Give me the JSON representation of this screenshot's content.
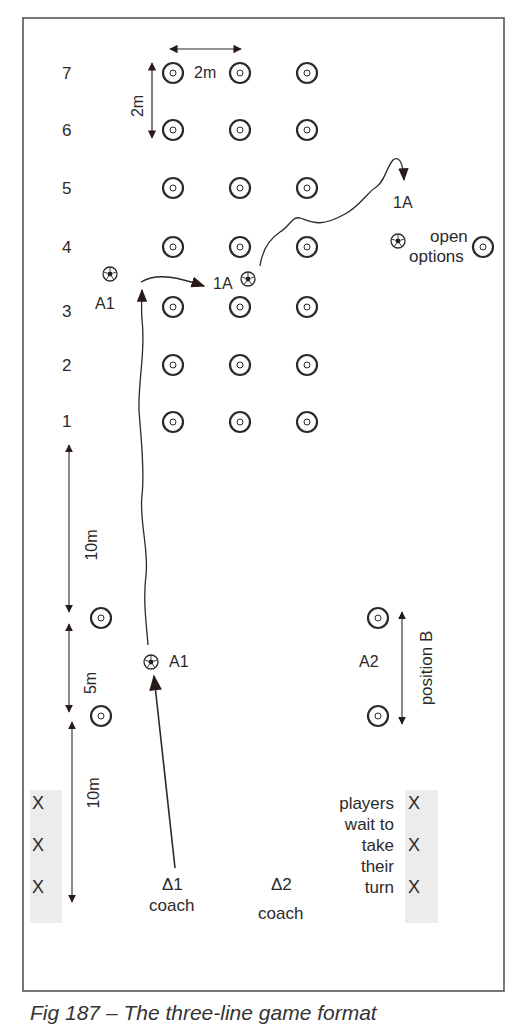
{
  "title": "Fig 187 – The three-line game format",
  "row_labels": [
    "7",
    "6",
    "5",
    "4",
    "3",
    "2",
    "1"
  ],
  "dimensions": {
    "cone_spacing_h": "2m",
    "cone_spacing_v": "2m",
    "run_distance_top": "10m",
    "gap_distance": "5m",
    "run_distance_bottom": "10m"
  },
  "players": {
    "a1_top": "A1",
    "onea_mid": "1A",
    "onea_top": "1A",
    "a1_start": "A1",
    "a2": "A2"
  },
  "annotations": {
    "open_options_line1": "open",
    "open_options_line2": "options",
    "position_b": "position B",
    "players_wait": [
      "players",
      "wait to",
      "take",
      "their",
      "turn"
    ]
  },
  "coaches": [
    {
      "symbol": "Δ1",
      "label": "coach"
    },
    {
      "symbol": "Δ2",
      "label": "coach"
    }
  ],
  "queues": {
    "left": [
      "X",
      "X",
      "X"
    ],
    "right": [
      "X",
      "X",
      "X"
    ]
  },
  "colors": {
    "ink": "#2a2a2a",
    "arrow": "#2b1a1a",
    "band": "#ececec",
    "border": "#555555"
  }
}
